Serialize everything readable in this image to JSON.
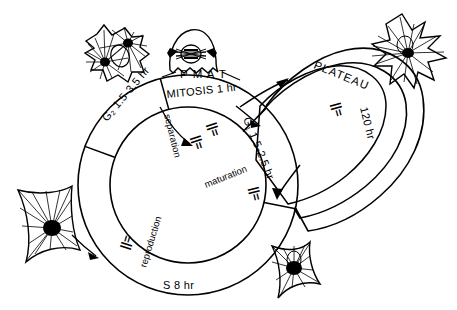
{
  "figure": {
    "background_color": "#ffffff",
    "ink_color": "#000000"
  },
  "cycle": {
    "phases": [
      {
        "id": "g2",
        "label": "G₂ 1.5-3.5 hr",
        "name": "G2",
        "duration": "1.5-3.5 hr"
      },
      {
        "id": "mitosis",
        "label": "MITOSIS 1 hr",
        "name": "MITOSIS",
        "duration": "1 hr"
      },
      {
        "id": "g1",
        "label": "G₁ 1.5-2.5 hr",
        "name": "G1",
        "duration": "1.5-2.5 hr"
      },
      {
        "id": "s",
        "label": "S  8 hr",
        "name": "S",
        "duration": "8 hr"
      }
    ],
    "mitosis_substages": "P M A T"
  },
  "plateau": {
    "label_text": "PLATEAU",
    "duration": "120 hr",
    "marker": "||="
  },
  "inner_annotations": [
    {
      "id": "separation",
      "label": "separation",
      "marker": "||="
    },
    {
      "id": "maturation",
      "label": "maturation",
      "marker": "||="
    },
    {
      "id": "reproduction",
      "label": "reproduction",
      "marker": "||="
    }
  ],
  "markers": {
    "mitosis_exit": "||=",
    "plateau": "||="
  },
  "cells": [
    {
      "id": "cell-telophase",
      "name": "telophase-cell",
      "position": "top-left"
    },
    {
      "id": "cell-metaphase",
      "name": "metaphase-cell",
      "position": "top-center"
    },
    {
      "id": "cell-aster-right",
      "name": "aster-cell",
      "position": "top-right"
    },
    {
      "id": "cell-aster-left",
      "name": "aster-cell",
      "position": "left"
    },
    {
      "id": "cell-aster-bottom",
      "name": "aster-cell",
      "position": "bottom-right"
    }
  ]
}
